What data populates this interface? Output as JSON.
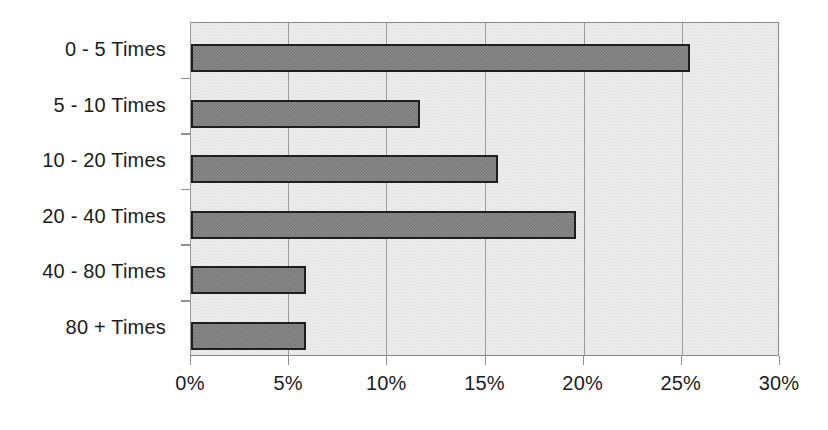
{
  "chart_data": {
    "type": "bar",
    "orientation": "horizontal",
    "title": "",
    "subtitle": "",
    "xlabel": "",
    "ylabel": "",
    "categories": [
      "0 - 5 Times",
      "5 - 10 Times",
      "10 - 20 Times",
      "20 - 40 Times",
      "40 - 80 Times",
      "80 + Times"
    ],
    "values": [
      25.5,
      11.7,
      15.7,
      19.7,
      5.9,
      5.9
    ],
    "value_unit": "%",
    "xlim": [
      0,
      30
    ],
    "xtick_values": [
      0,
      5,
      10,
      15,
      20,
      25,
      30
    ],
    "xtick_labels": [
      "0%",
      "5%",
      "10%",
      "15%",
      "20%",
      "25%",
      "30%"
    ],
    "grid": "vertical",
    "legend": "none",
    "annotations": [],
    "colors": {
      "bar_fill": "#8d8d8d",
      "bar_pattern": "#6f6f6f",
      "bar_border": "#1f1f1f",
      "plot_background": "#eeeeee",
      "plot_background_pattern": "#e2e2e2",
      "gridline": "#9d9d9d",
      "axis_line": "#8a8a8a",
      "text": "#1c1c1c",
      "page_background": "#ffffff"
    }
  }
}
